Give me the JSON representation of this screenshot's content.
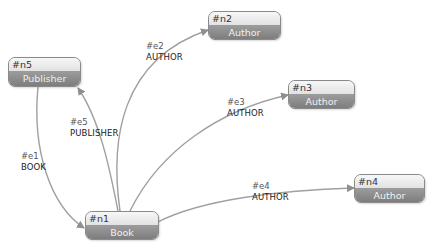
{
  "colors": {
    "edge": "#9a9a9a",
    "node_border": "#8a8a8a",
    "node_label_bg": "#8c8c8c",
    "node_id_bg": "#efefef"
  },
  "nodes": [
    {
      "id": "#n1",
      "label": "Book"
    },
    {
      "id": "#n2",
      "label": "Author"
    },
    {
      "id": "#n3",
      "label": "Author"
    },
    {
      "id": "#n4",
      "label": "Author"
    },
    {
      "id": "#n5",
      "label": "Publisher"
    }
  ],
  "edges": [
    {
      "id": "#e1",
      "type": "BOOK",
      "from": "#n5",
      "to": "#n1"
    },
    {
      "id": "#e2",
      "type": "AUTHOR",
      "from": "#n1",
      "to": "#n2"
    },
    {
      "id": "#e3",
      "type": "AUTHOR",
      "from": "#n1",
      "to": "#n3"
    },
    {
      "id": "#e4",
      "type": "AUTHOR",
      "from": "#n1",
      "to": "#n4"
    },
    {
      "id": "#e5",
      "type": "PUBLISHER",
      "from": "#n1",
      "to": "#n5"
    }
  ]
}
